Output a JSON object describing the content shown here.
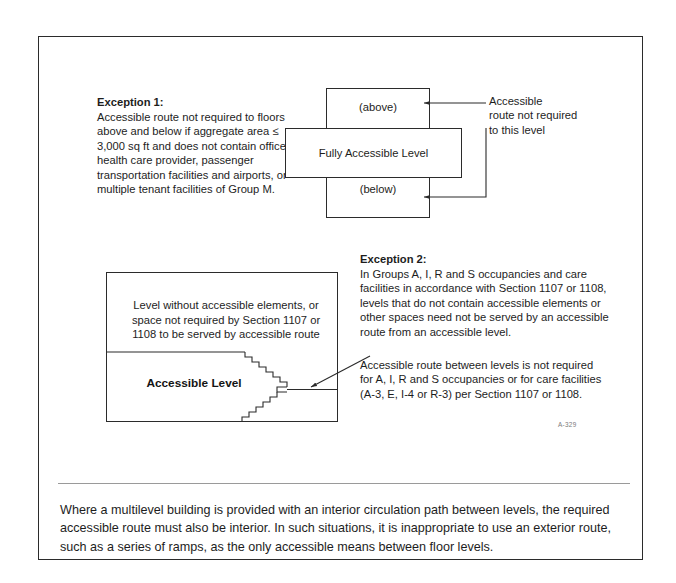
{
  "figure": {
    "code": "A-329",
    "exception1": {
      "heading": "Exception 1:",
      "body": "Accessible route not required to floors above and below if aggregate area ≤ 3,000 sq ft and does not contain office of health care provider, passenger transportation facilities and airports, or multiple tenant facilities of Group M."
    },
    "exception2": {
      "heading": "Exception 2:",
      "body": "In Groups A, I, R and S occupancies and care facilities in accordance with Section 1107 or 1108, levels that do not contain accessible elements or other spaces need not be served by an accessible route from an accessible level."
    },
    "top_diagram": {
      "box_above_label": "(above)",
      "box_below_label": "(below)",
      "box_middle_label": "Fully Accessible Level",
      "callout": "Accessible\nroute not required\nto this level"
    },
    "lower_diagram": {
      "upper_space_label": "Level without accessible elements, or space not required by Section 1107 or 1108 to be served by accessible route",
      "accessible_level_label": "Accessible Level",
      "callout": "Accessible route between levels is not required for A, I, R and S occupancies or for care facilities (A-3, E, I-4 or R-3) per Section 1107 or 1108."
    },
    "caption": "Where a multilevel building is provided with an interior circulation path between levels, the required accessible route must also be interior. In such situations, it is inappropriate to use an exterior route, such as a series of ramps, as the only accessible means between floor levels."
  },
  "colors": {
    "ink": "#1d1d1d",
    "line": "#2b2b2b",
    "rule": "#9a9a9a",
    "code": "#7b7b7b",
    "paper": "#ffffff"
  }
}
